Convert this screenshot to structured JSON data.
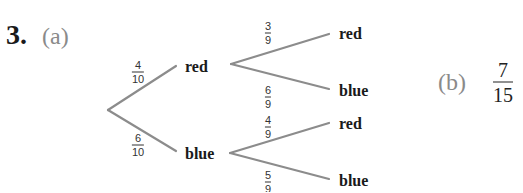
{
  "question": {
    "number": "3.",
    "part_a_label": "(a)",
    "part_b_label": "(b)",
    "part_b_answer": {
      "numerator": "7",
      "denominator": "15"
    }
  },
  "tree": {
    "first_draw": [
      {
        "outcome": "red",
        "prob": {
          "numerator": "4",
          "denominator": "10"
        }
      },
      {
        "outcome": "blue",
        "prob": {
          "numerator": "6",
          "denominator": "10"
        }
      }
    ],
    "second_draw": {
      "after_red": [
        {
          "outcome": "red",
          "prob": {
            "numerator": "3",
            "denominator": "9"
          }
        },
        {
          "outcome": "blue",
          "prob": {
            "numerator": "6",
            "denominator": "9"
          }
        }
      ],
      "after_blue": [
        {
          "outcome": "red",
          "prob": {
            "numerator": "4",
            "denominator": "9"
          }
        },
        {
          "outcome": "blue",
          "prob": {
            "numerator": "5",
            "denominator": "9"
          }
        }
      ]
    }
  },
  "colors": {
    "branch_line": "#8c8c8c",
    "part_label": "#8a8a8a",
    "text": "#1a1a1a"
  }
}
